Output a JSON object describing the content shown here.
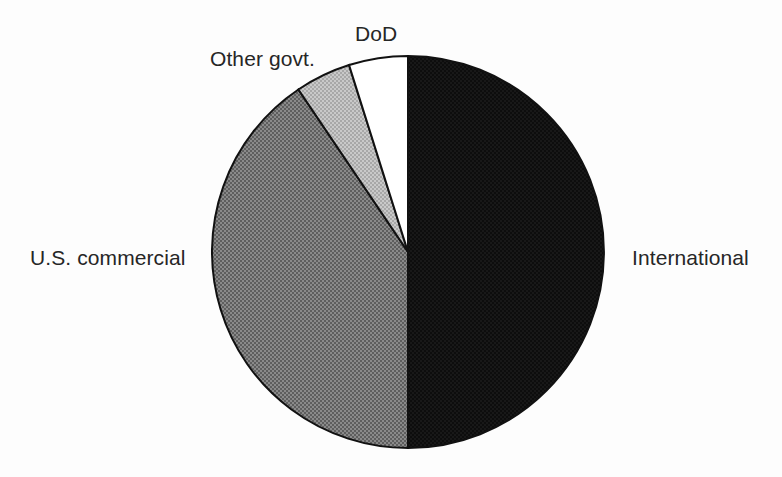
{
  "chart_data": {
    "type": "pie",
    "title": "",
    "subtitle": "",
    "xlabel": "",
    "ylabel": "",
    "legend_position": "none",
    "grid": false,
    "labels_on_slices": false,
    "label_placement": "outside-callout",
    "start_angle_deg": 0,
    "direction": "clockwise",
    "categories": [
      "International",
      "U.S. commercial",
      "Other govt.",
      "DoD"
    ],
    "values": [
      50.0,
      40.6,
      4.6,
      4.8
    ],
    "units": "percent",
    "slices": [
      {
        "label": "International",
        "value": 50.0,
        "angle_deg": 180.0,
        "start_angle_deg": 0.0,
        "end_angle_deg": 180.0,
        "color": "#0d0d0d",
        "fill_style": "solid-black"
      },
      {
        "label": "U.S. commercial",
        "value": 40.6,
        "angle_deg": 146.0,
        "start_angle_deg": 180.0,
        "end_angle_deg": 326.0,
        "color": "#777777",
        "fill_style": "halftone-dark-gray"
      },
      {
        "label": "Other govt.",
        "value": 4.6,
        "angle_deg": 16.5,
        "start_angle_deg": 326.0,
        "end_angle_deg": 342.5,
        "color": "#b8b8b8",
        "fill_style": "halftone-light-gray"
      },
      {
        "label": "DoD",
        "value": 4.8,
        "angle_deg": 17.5,
        "start_angle_deg": 342.5,
        "end_angle_deg": 360.0,
        "color": "#ffffff",
        "fill_style": "white"
      }
    ],
    "outline_color": "#111111",
    "background_color": "#fdfdfd"
  },
  "labels": {
    "dod": "DoD",
    "other_govt": "Other govt.",
    "us_commercial": "U.S. commercial",
    "international": "International"
  },
  "geometry": {
    "center_x": 408,
    "center_y": 252,
    "radius": 196
  }
}
